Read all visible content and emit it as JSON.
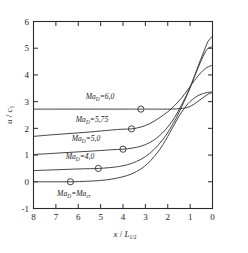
{
  "chart_data": {
    "type": "line",
    "title": "",
    "xlabel": "x / L1/2",
    "ylabel": "u / c1",
    "xlim": [
      8,
      0
    ],
    "ylim": [
      -1,
      6
    ],
    "x_reversed": true,
    "grid": false,
    "legend_position": "inline-labels",
    "xticks": [
      8,
      7,
      6,
      5,
      4,
      3,
      2,
      1,
      0
    ],
    "xtick_labels": [
      "8",
      "7",
      "6",
      "5",
      "4",
      "3",
      "2",
      "1",
      "0"
    ],
    "yticks": [
      -1,
      0,
      1,
      2,
      3,
      4,
      5,
      6
    ],
    "ytick_labels": [
      "-1",
      "0",
      "1",
      "2",
      "3",
      "4",
      "5",
      "6"
    ],
    "series": [
      {
        "name": "Ma_D=6,0",
        "label": "Ma",
        "label_sub": "D",
        "label_rest": "=6,0",
        "plateau": 2.72,
        "marker_x": 3.2,
        "marker_y": 2.72,
        "x": [
          8.0,
          7.0,
          6.0,
          5.0,
          4.0,
          3.2,
          3.0,
          2.5,
          2.0,
          1.6,
          1.3,
          1.0,
          0.75,
          0.5,
          0.25,
          0.0
        ],
        "y": [
          2.72,
          2.72,
          2.72,
          2.72,
          2.72,
          2.72,
          2.72,
          2.72,
          2.72,
          2.73,
          2.75,
          2.82,
          2.95,
          3.1,
          3.25,
          3.35
        ]
      },
      {
        "name": "Ma_D=5,75",
        "label": "Ma",
        "label_sub": "D",
        "label_rest": "=5,75",
        "plateau": 1.7,
        "marker_x": 3.62,
        "marker_y": 1.98,
        "x": [
          8.0,
          7.0,
          6.0,
          5.0,
          4.5,
          4.0,
          3.62,
          3.2,
          2.8,
          2.4,
          2.0,
          1.7,
          1.4,
          1.1,
          0.8,
          0.5,
          0.25,
          0.0
        ],
        "y": [
          1.7,
          1.77,
          1.83,
          1.9,
          1.94,
          1.97,
          1.98,
          2.05,
          2.18,
          2.38,
          2.62,
          2.85,
          3.12,
          3.45,
          3.8,
          4.1,
          4.28,
          4.36
        ]
      },
      {
        "name": "Ma_D=5,0",
        "label": "Ma",
        "label_sub": "D",
        "label_rest": "=5,0",
        "plateau": 1.02,
        "marker_x": 4.0,
        "marker_y": 1.22,
        "x": [
          8.0,
          7.0,
          6.0,
          5.0,
          4.5,
          4.0,
          3.6,
          3.2,
          2.8,
          2.4,
          2.0,
          1.7,
          1.4,
          1.1,
          0.8,
          0.5,
          0.25,
          0.0
        ],
        "y": [
          1.02,
          1.07,
          1.12,
          1.17,
          1.2,
          1.22,
          1.26,
          1.33,
          1.47,
          1.7,
          2.05,
          2.4,
          2.85,
          3.35,
          3.95,
          4.55,
          4.95,
          5.06
        ]
      },
      {
        "name": "Ma_D=4,0",
        "label": "Ma",
        "label_sub": "D",
        "label_rest": "=4,0",
        "plateau": 0.42,
        "marker_x": 5.1,
        "marker_y": 0.5,
        "x": [
          8.0,
          7.0,
          6.0,
          5.5,
          5.1,
          4.6,
          4.2,
          3.8,
          3.4,
          3.0,
          2.6,
          2.2,
          1.9,
          1.6,
          1.3,
          1.0,
          0.7,
          0.4,
          0.2,
          0.0
        ],
        "y": [
          0.42,
          0.45,
          0.48,
          0.49,
          0.5,
          0.53,
          0.57,
          0.64,
          0.76,
          0.94,
          1.22,
          1.6,
          1.98,
          2.42,
          2.95,
          3.52,
          4.2,
          4.85,
          5.25,
          5.45
        ]
      },
      {
        "name": "Ma_D=Ma_cr",
        "label": "Ma",
        "label_sub": "D",
        "label_rest": "=Ma",
        "label_sub2": "cr",
        "plateau": 0.0,
        "marker_x": 6.35,
        "marker_y": 0.0,
        "x": [
          8.0,
          7.2,
          6.35,
          5.6,
          5.0,
          4.5,
          4.0,
          3.6,
          3.2,
          2.9,
          2.6,
          2.35,
          2.1,
          1.9,
          1.7,
          1.5,
          1.3,
          1.1,
          0.9,
          0.7,
          0.5,
          0.3,
          0.15,
          0.0
        ],
        "y": [
          0.0,
          0.0,
          0.0,
          0.02,
          0.05,
          0.1,
          0.19,
          0.3,
          0.48,
          0.68,
          0.95,
          1.22,
          1.55,
          1.85,
          2.15,
          2.45,
          2.7,
          2.92,
          3.08,
          3.2,
          3.28,
          3.33,
          3.35,
          3.36
        ]
      }
    ],
    "markers": {
      "shape": "circle",
      "fill": "none",
      "radius": 3.1
    },
    "colors": {
      "curve": "#3a3a3a",
      "axis": "#2a2a2a",
      "text": "#1f1f1f",
      "background": "#ffffff"
    }
  },
  "axis_titles": {
    "x_main": "x",
    "x_slash": "/",
    "x_var": "L",
    "x_sub": "1/2",
    "y_main": "u",
    "y_slash": "/",
    "y_var": "c",
    "y_sub": "1"
  },
  "curve_labels": [
    {
      "text": "Ma",
      "sub": "D",
      "rest": "=6,0",
      "x": 100,
      "y": 98.5
    },
    {
      "text": "Ma",
      "sub": "D",
      "rest": "=5,75",
      "x": 92,
      "y": 122
    },
    {
      "text": "Ma",
      "sub": "D",
      "rest": "=5,0",
      "x": 86,
      "y": 141
    },
    {
      "text": "Ma",
      "sub": "D",
      "rest": "=4,0",
      "x": 80,
      "y": 159
    },
    {
      "text": "Ma",
      "sub": "D",
      "rest": "=Ma",
      "sub2": "cr",
      "x": 74,
      "y": 196
    }
  ]
}
